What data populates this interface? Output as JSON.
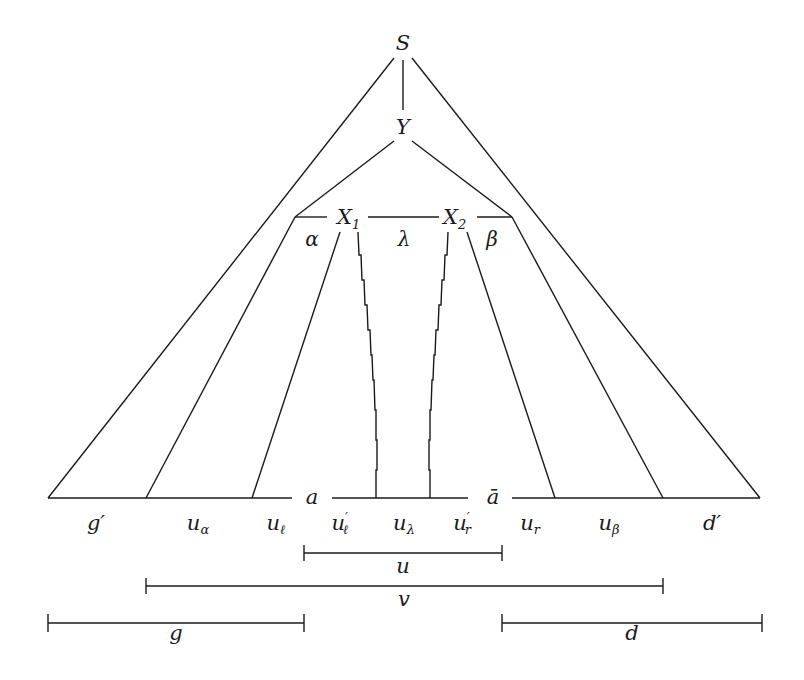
{
  "nodes": {
    "root": "S",
    "child": "Y",
    "x1": {
      "base": "X",
      "sub": "1"
    },
    "x2": {
      "base": "X",
      "sub": "2"
    }
  },
  "region_labels": {
    "alpha": "α",
    "lambda": "λ",
    "beta": "β"
  },
  "base_markers": {
    "a": "a",
    "a_bar": "ā"
  },
  "segment_labels": {
    "g_prime": {
      "base": "g",
      "prime": "′"
    },
    "u_alpha": {
      "base": "u",
      "sub": "α"
    },
    "u_ell": {
      "base": "u",
      "sub": "ℓ"
    },
    "u_ell_prime": {
      "base": "u",
      "prime": "′",
      "sub": "ℓ"
    },
    "u_lambda": {
      "base": "u",
      "sub": "λ"
    },
    "u_r_prime": {
      "base": "u",
      "prime": "′",
      "sub": "r"
    },
    "u_r": {
      "base": "u",
      "sub": "r"
    },
    "u_beta": {
      "base": "u",
      "sub": "β"
    },
    "d_prime": {
      "base": "d",
      "prime": "′"
    }
  },
  "spans": {
    "u": "u",
    "v": "v",
    "g": "g",
    "d": "d"
  }
}
